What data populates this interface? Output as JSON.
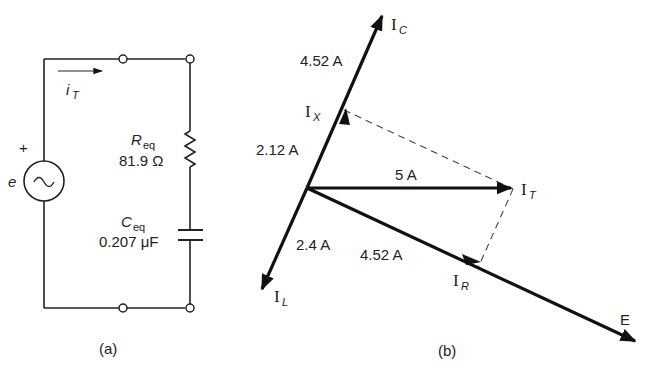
{
  "figure_a": {
    "caption": "(a)",
    "source": {
      "label": "e",
      "polarity": "+",
      "symbol": "~"
    },
    "current": {
      "symbol": "i",
      "subscript": "T"
    },
    "resistor": {
      "symbol": "R",
      "subscript": "eq",
      "value": "81.9 Ω"
    },
    "capacitor": {
      "symbol": "C",
      "subscript": "eq",
      "value": "0.207 μF"
    }
  },
  "figure_b": {
    "caption": "(b)",
    "vectors": {
      "IC": {
        "symbol": "I",
        "subscript": "C",
        "magnitude": "4.52 A"
      },
      "IX": {
        "symbol": "I",
        "subscript": "X",
        "magnitude": "2.12 A"
      },
      "IT": {
        "symbol": "I",
        "subscript": "T",
        "magnitude": "5 A"
      },
      "IL": {
        "symbol": "I",
        "subscript": "L",
        "magnitude": "2.4 A"
      },
      "IR": {
        "symbol": "I",
        "subscript": "R",
        "magnitude": "4.52 A"
      },
      "E": {
        "symbol": "E"
      }
    }
  }
}
